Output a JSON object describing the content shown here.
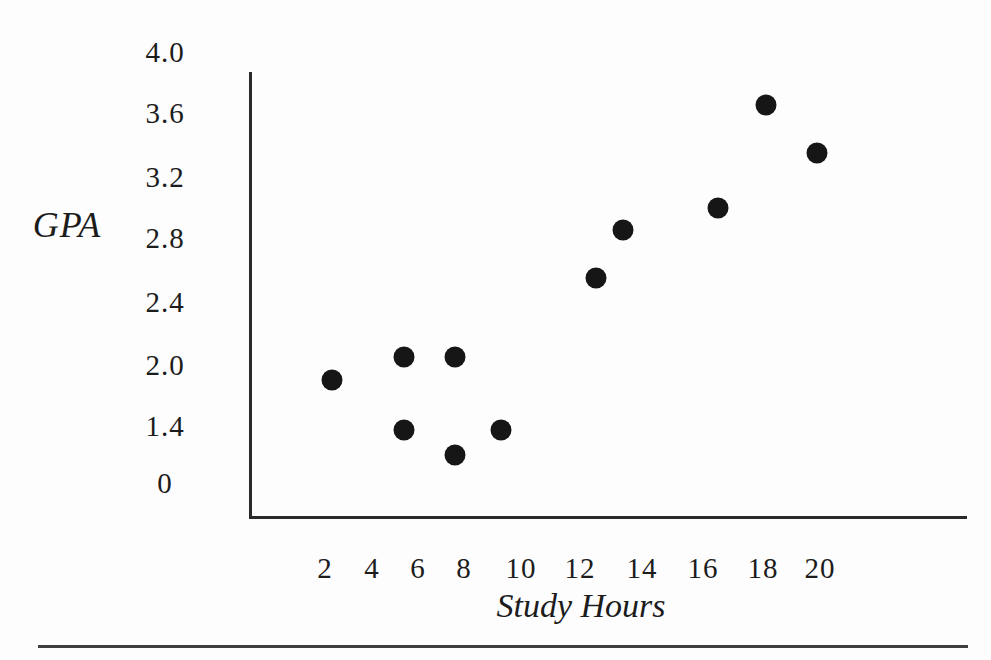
{
  "figure": {
    "background": "#fdfdfd",
    "ink_color": "#1c1c1c",
    "axis_color": "#2a2a2a",
    "rule_color": "#3f3f3f"
  },
  "chart_data": {
    "type": "scatter",
    "xlabel": "Study Hours",
    "ylabel": "GPA",
    "x_tick_labels": [
      "2",
      "4",
      "6",
      "8",
      "10",
      "12",
      "14",
      "16",
      "18",
      "20"
    ],
    "y_tick_labels": [
      "4.0",
      "3.6",
      "3.2",
      "2.8",
      "2.4",
      "2.0",
      "1.4",
      "0"
    ],
    "x_axis_range_shown": [
      2,
      20
    ],
    "y_axis_range_shown": [
      0,
      4.0
    ],
    "grid": "off",
    "legend": "none",
    "marker": {
      "shape": "circle",
      "color": "#161616",
      "diameter_px": 21
    },
    "points": [
      {
        "x": 2.3,
        "y": 1.85
      },
      {
        "x": 5.4,
        "y": 2.05
      },
      {
        "x": 7.6,
        "y": 2.05
      },
      {
        "x": 5.4,
        "y": 1.3
      },
      {
        "x": 7.6,
        "y": 0.7
      },
      {
        "x": 9.3,
        "y": 1.3
      },
      {
        "x": 12.5,
        "y": 2.55
      },
      {
        "x": 13.4,
        "y": 2.85
      },
      {
        "x": 16.5,
        "y": 3.0
      },
      {
        "x": 18.1,
        "y": 3.65
      },
      {
        "x": 19.9,
        "y": 3.35
      }
    ]
  }
}
